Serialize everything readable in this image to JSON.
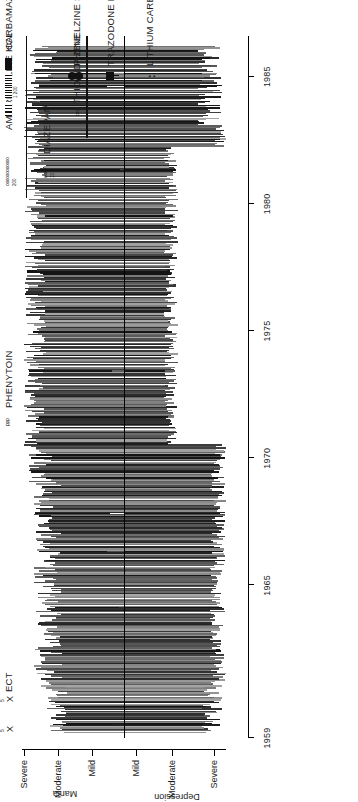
{
  "figure": {
    "title": "",
    "orientation": "rotated-90-ccw"
  },
  "chart_data": {
    "type": "area",
    "xlabel": "",
    "ylabel": "",
    "x": [
      1959,
      1965,
      1970,
      1975,
      1980,
      1985
    ],
    "xlim": [
      1959,
      1986.5
    ],
    "grid": false,
    "legend_position": "top",
    "y_axis": {
      "above_baseline_group": "Mania",
      "below_baseline_group": "Depression",
      "ticks_top_to_bottom": [
        "Severe",
        "Moderate",
        "Mild",
        "Mild",
        "Moderate",
        "Severe"
      ],
      "baseline_label": "euthymic"
    },
    "categories": [
      "Severe",
      "Moderate",
      "Mild",
      "Mild",
      "Moderate",
      "Severe"
    ],
    "values": [
      0,
      0,
      0,
      0,
      0,
      0
    ],
    "series": [
      {
        "name": "Mania severity",
        "note": "dense vertical episode bars above baseline"
      },
      {
        "name": "Depression severity",
        "note": "dense vertical episode bars below baseline"
      }
    ]
  },
  "xaxis": {
    "ticks": [
      {
        "label": "1959",
        "year": 1959
      },
      {
        "label": "1965",
        "year": 1965
      },
      {
        "label": "1970",
        "year": 1970
      },
      {
        "label": "1975",
        "year": 1975
      },
      {
        "label": "1980",
        "year": 1980
      },
      {
        "label": "1985",
        "year": 1985
      }
    ]
  },
  "yaxis": {
    "mania_group_label": "Mania",
    "depression_group_label": "Depression",
    "mania_ticks": [
      "Severe",
      "Moderate",
      "Mild"
    ],
    "depression_ticks": [
      "Mild",
      "Moderate",
      "Severe"
    ]
  },
  "annotations": {
    "ect": {
      "label": "ECT",
      "marker": "X",
      "courses": [
        {
          "marker": "X",
          "count": "5"
        },
        {
          "marker": "X",
          "count": "5"
        }
      ]
    },
    "drugs": [
      {
        "name": "PHENYTOIN",
        "key": "ppp",
        "dose": ""
      },
      {
        "name": "AMITRIPTYLINE HCL",
        "key": "oooooo",
        "dose": "200"
      },
      {
        "name": "DIAZEPAM",
        "key": "oooo",
        "dose": "10"
      },
      {
        "name": "CARBAMAZEPINE",
        "key": "hatch",
        "dose": "1 200"
      },
      {
        "name": "THIORIDAZINE",
        "key": "oo",
        "dose": ""
      },
      {
        "name": "PHENELZINE SULFATE",
        "key": "circle",
        "dose": ""
      },
      {
        "name": "TRAZODONE HCL",
        "key": "square",
        "dose": ""
      },
      {
        "name": "LITHIUM CARBONATE",
        "key": "colon",
        "dose": ""
      }
    ]
  }
}
